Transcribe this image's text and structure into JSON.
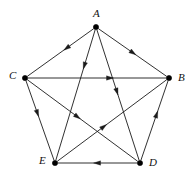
{
  "figure": {
    "name": "directed-pentagon-graph",
    "type": "directed-graph",
    "width": 194,
    "height": 183,
    "background_color": "#ffffff",
    "line_color": "#1a1a1a",
    "vertex_color": "#000000",
    "label_color": "#111111"
  },
  "graph_data": {
    "type": "directed-graph",
    "title": "",
    "vertex_count": 5,
    "edge_count": 10,
    "vertices": [
      {
        "id": "A",
        "label": "A",
        "x": 96,
        "y": 27,
        "label_x": 93,
        "label_y": 8,
        "label_position": "above"
      },
      {
        "id": "B",
        "label": "B",
        "x": 169,
        "y": 78,
        "label_x": 178,
        "label_y": 72,
        "label_position": "right"
      },
      {
        "id": "C",
        "label": "C",
        "x": 25,
        "y": 78,
        "label_x": 9,
        "label_y": 70,
        "label_position": "left"
      },
      {
        "id": "D",
        "label": "D",
        "x": 140,
        "y": 163,
        "label_x": 149,
        "label_y": 157,
        "label_position": "right"
      },
      {
        "id": "E",
        "label": "E",
        "x": 55,
        "y": 163,
        "label_x": 39,
        "label_y": 155,
        "label_position": "left"
      }
    ],
    "edges": [
      {
        "id": "A-C",
        "from": "A",
        "to": "C",
        "kind": "side",
        "arrow_t": 0.45
      },
      {
        "id": "A-B",
        "from": "A",
        "to": "B",
        "kind": "side",
        "arrow_t": 0.55
      },
      {
        "id": "C-B",
        "from": "C",
        "to": "B",
        "kind": "side",
        "arrow_t": 0.62
      },
      {
        "id": "C-E",
        "from": "C",
        "to": "E",
        "kind": "side",
        "arrow_t": 0.45
      },
      {
        "id": "D-B",
        "from": "D",
        "to": "B",
        "kind": "side",
        "arrow_t": 0.62
      },
      {
        "id": "D-E",
        "from": "D",
        "to": "E",
        "kind": "side",
        "arrow_t": 0.55
      },
      {
        "id": "A-E",
        "from": "A",
        "to": "E",
        "kind": "diagonal",
        "arrow_t": 0.3
      },
      {
        "id": "A-D",
        "from": "A",
        "to": "D",
        "kind": "diagonal",
        "arrow_t": 0.5
      },
      {
        "id": "C-D",
        "from": "C",
        "to": "D",
        "kind": "diagonal",
        "arrow_t": 0.48
      },
      {
        "id": "E-B",
        "from": "E",
        "to": "B",
        "kind": "diagonal",
        "arrow_t": 0.45
      }
    ],
    "adjacency_list": {
      "A": [
        "C",
        "B",
        "E",
        "D"
      ],
      "B": [],
      "C": [
        "B",
        "E",
        "D"
      ],
      "D": [
        "B",
        "E"
      ],
      "E": [
        "B"
      ]
    },
    "out_degrees": {
      "A": 4,
      "B": 0,
      "C": 3,
      "D": 2,
      "E": 1
    },
    "in_degrees": {
      "A": 0,
      "B": 4,
      "C": 1,
      "D": 2,
      "E": 3
    }
  },
  "render": {
    "vertex_radius": 2.6,
    "arrow_length": 7.0,
    "arrow_half_width": 2.2,
    "edge_stroke_width": 0.9,
    "vertex_gap": 3.2
  }
}
